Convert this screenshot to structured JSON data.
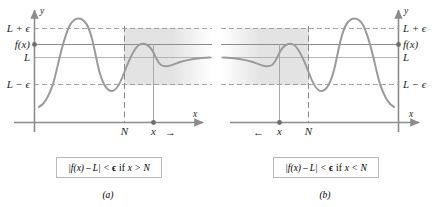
{
  "figure": {
    "type": "math-diagram",
    "background_color": "#ffffff",
    "curve_color": "#9a9a9a",
    "axis_color": "#8c8c8c",
    "dashed_color": "#9a9a9a",
    "band_color": "#e3e3e3",
    "text_color": "#231f20"
  },
  "panels": [
    {
      "id": "a",
      "sublabel": "(a)",
      "caption": "| f(x) − L | < ϵ if x > N",
      "caption_parts": {
        "abs_open": "|",
        "fx": "f(x)",
        "minus": "–",
        "L": "L",
        "abs_close": "|",
        "lt": "<",
        "eps": "ϵ",
        "if": "if",
        "x": "x",
        "rel": ">",
        "N": "N"
      },
      "axes": {
        "x_label": "x",
        "y_label": "y",
        "label_side": "left"
      },
      "y_labels": [
        {
          "name": "L-plus-epsilon",
          "text": "L + ϵ"
        },
        {
          "name": "f-of-x",
          "text": "f(x)"
        },
        {
          "name": "L",
          "text": "L"
        },
        {
          "name": "L-minus-epsilon",
          "text": "L − ϵ"
        }
      ],
      "x_labels": [
        {
          "name": "N",
          "text": "N"
        },
        {
          "name": "x",
          "text": "x"
        }
      ],
      "arrow": {
        "name": "x-direction-arrow",
        "direction": "right",
        "glyph": "→"
      },
      "band": {
        "starts_at": "N",
        "extends": "right",
        "fade": "right"
      }
    },
    {
      "id": "b",
      "sublabel": "(b)",
      "caption": "| f(x) − L | < ϵ if x < N",
      "caption_parts": {
        "abs_open": "|",
        "fx": "f(x)",
        "minus": "–",
        "L": "L",
        "abs_close": "|",
        "lt": "<",
        "eps": "ϵ",
        "if": "if",
        "x": "x",
        "rel": "<",
        "N": "N"
      },
      "axes": {
        "x_label": "x",
        "y_label": "y",
        "label_side": "right"
      },
      "y_labels": [
        {
          "name": "L-plus-epsilon",
          "text": "L + ϵ"
        },
        {
          "name": "f-of-x",
          "text": "f(x)"
        },
        {
          "name": "L",
          "text": "L"
        },
        {
          "name": "L-minus-epsilon",
          "text": "L − ϵ"
        }
      ],
      "x_labels": [
        {
          "name": "x",
          "text": "x"
        },
        {
          "name": "N",
          "text": "N"
        }
      ],
      "arrow": {
        "name": "x-direction-arrow",
        "direction": "left",
        "glyph": "←"
      },
      "band": {
        "starts_at": "N",
        "extends": "left",
        "fade": "left"
      }
    }
  ]
}
